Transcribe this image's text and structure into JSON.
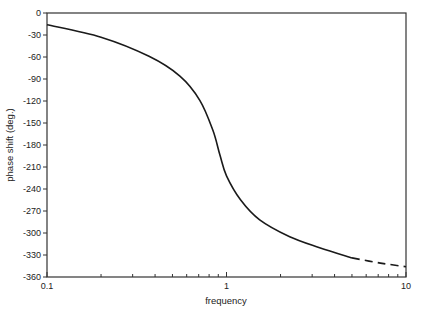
{
  "chart_data": {
    "type": "line",
    "title": "",
    "xlabel": "frequency",
    "ylabel": "phase shift (deg.)",
    "xscale": "log",
    "xlim": [
      0.1,
      10
    ],
    "ylim": [
      -360,
      0
    ],
    "grid": false,
    "legend": null,
    "x_ticks": [
      "0.1",
      "1",
      "10"
    ],
    "y_ticks": [
      "0",
      "-30",
      "-60",
      "-90",
      "-120",
      "-150",
      "-180",
      "-210",
      "-240",
      "-270",
      "-300",
      "-330",
      "-360"
    ],
    "series": [
      {
        "name": "phase",
        "style": "solid",
        "x": [
          0.1,
          0.2,
          0.37,
          0.55,
          0.71,
          0.84,
          0.92,
          1.0,
          1.2,
          1.53,
          2.25,
          3.3,
          5.0
        ],
        "y": [
          -16,
          -33,
          -59,
          -86,
          -119,
          -160,
          -194,
          -222,
          -255,
          -282,
          -305,
          -320,
          -334
        ]
      },
      {
        "name": "phase (extrapolated)",
        "style": "dashed",
        "x": [
          5.0,
          7.2,
          10.0
        ],
        "y": [
          -334,
          -341,
          -346
        ]
      }
    ]
  },
  "axes": {
    "xlabel": "frequency",
    "ylabel": "phase shift (deg.)"
  }
}
